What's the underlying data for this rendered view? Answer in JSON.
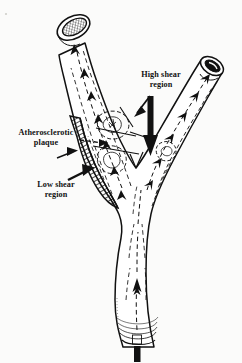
{
  "figure": {
    "background_color": "#fbfbfa",
    "ink_color": "#111111",
    "labels": [
      {
        "id": "atherosclerotic-plaque",
        "line1": "Atherosclerotic",
        "line2": "plaque",
        "pointer": "dashed-leader-line"
      },
      {
        "id": "low-shear-region",
        "line1": "Low shear",
        "line2": "region",
        "pointer": "bold-arrow"
      },
      {
        "id": "high-shear-region",
        "line1": "High shear",
        "line2": "region",
        "pointer": "bold-down-arrow"
      }
    ],
    "annotations": {
      "flow_direction": "upward",
      "streamline_style": "dashed-with-arrowheads",
      "plaque_fill": "diagonal-hatching",
      "lumen_fill": "cross-hatching"
    }
  }
}
